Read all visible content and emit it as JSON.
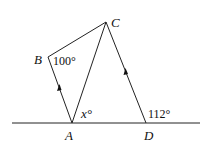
{
  "diagram": {
    "points": {
      "A": "A",
      "B": "B",
      "C": "C",
      "D": "D"
    },
    "angles": {
      "B": "100°",
      "A": "x°",
      "D": "112°"
    },
    "parallel_marks": [
      "AB",
      "DC"
    ]
  }
}
